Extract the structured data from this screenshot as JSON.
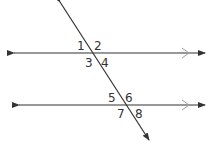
{
  "diagram": {
    "colors": {
      "line": "#333333",
      "parallel_mark": "#a0a0a0",
      "text": "#333333"
    },
    "angle_labels": [
      {
        "id": "1",
        "text": "1",
        "x": 77,
        "y": 50
      },
      {
        "id": "2",
        "text": "2",
        "x": 94,
        "y": 50
      },
      {
        "id": "3",
        "text": "3",
        "x": 85,
        "y": 67
      },
      {
        "id": "4",
        "text": "4",
        "x": 101,
        "y": 67
      },
      {
        "id": "5",
        "text": "5",
        "x": 108,
        "y": 102
      },
      {
        "id": "6",
        "text": "6",
        "x": 125,
        "y": 102
      },
      {
        "id": "7",
        "text": "7",
        "x": 117,
        "y": 118
      },
      {
        "id": "8",
        "text": "8",
        "x": 135,
        "y": 118
      }
    ]
  }
}
